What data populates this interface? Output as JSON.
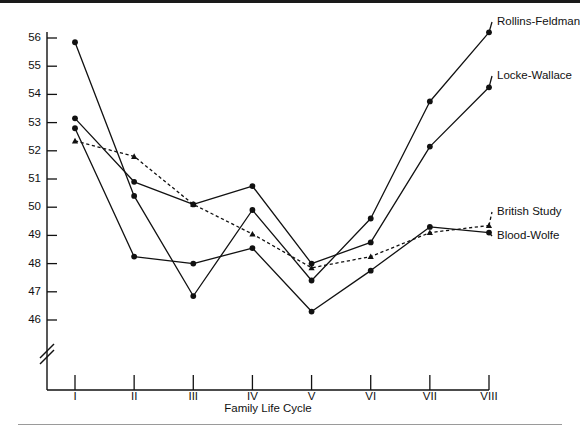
{
  "figure": {
    "title": "",
    "x_axis_title": "Family Life Cycle"
  },
  "chart_data": {
    "type": "line",
    "title": "",
    "subtitle": "",
    "xlabel": "Family Life Cycle",
    "ylabel": "",
    "grid": false,
    "legend_position": "right-inline-labels",
    "axis_break": true,
    "axis_break_note": "y-axis broken below 46",
    "categories": [
      "I",
      "II",
      "III",
      "IV",
      "V",
      "VI",
      "VII",
      "VIII"
    ],
    "ylim": [
      46,
      56
    ],
    "yticks": [
      46,
      47,
      48,
      49,
      50,
      51,
      52,
      53,
      54,
      55,
      56
    ],
    "ytick_labels": [
      "46",
      "47",
      "48",
      "49",
      "50",
      "51",
      "52",
      "53",
      "54",
      "55",
      "56"
    ],
    "xtick_labels": [
      "I",
      "II",
      "III",
      "IV",
      "V",
      "VI",
      "VII",
      "VIII"
    ],
    "series": [
      {
        "name": "Rollins-Feldman",
        "style": "solid",
        "marker": "circle",
        "values": [
          55.85,
          50.4,
          46.85,
          49.9,
          47.4,
          49.6,
          53.75,
          56.2
        ]
      },
      {
        "name": "Locke-Wallace",
        "style": "solid",
        "marker": "circle",
        "values": [
          53.15,
          50.9,
          50.1,
          50.75,
          48.0,
          48.75,
          52.15,
          54.25
        ]
      },
      {
        "name": "Blood-Wolfe",
        "style": "solid",
        "marker": "circle",
        "values": [
          52.8,
          48.25,
          48.0,
          48.55,
          46.3,
          47.75,
          49.3,
          49.1
        ]
      },
      {
        "name": "British Study",
        "style": "dotted",
        "marker": "triangle",
        "values": [
          52.35,
          51.8,
          50.1,
          49.05,
          47.85,
          48.25,
          49.1,
          49.35
        ]
      }
    ],
    "annotations": [
      {
        "text": "Rollins-Feldman",
        "attached_to": "Rollins-Feldman",
        "at_category": "VIII"
      },
      {
        "text": "Locke-Wallace",
        "attached_to": "Locke-Wallace",
        "at_category": "VIII"
      },
      {
        "text": "British Study",
        "attached_to": "British Study",
        "at_category": "VIII"
      },
      {
        "text": "Blood-Wolfe",
        "attached_to": "Blood-Wolfe",
        "at_category": "VIII"
      }
    ]
  },
  "colors": {
    "ink": "#111111",
    "rule": "#1a1a1a",
    "background": "#ffffff"
  }
}
